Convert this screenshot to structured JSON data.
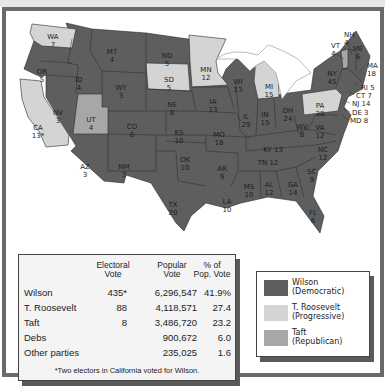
{
  "colors": {
    "wilson": "#5e5e5e",
    "roosevelt": "#d4d4d4",
    "taft": "#a7a7a7",
    "frame": "#6a6a6a",
    "water": "#ffffff"
  },
  "map": {
    "states": [
      {
        "abbr": "WA",
        "ev": "7",
        "winner": "roosevelt",
        "x": 47,
        "y": 22
      },
      {
        "abbr": "OR",
        "ev": "5",
        "winner": "wilson",
        "x": 36,
        "y": 57
      },
      {
        "abbr": "CA",
        "ev": "13*",
        "winner": "roosevelt",
        "x": 32,
        "y": 113
      },
      {
        "abbr": "ID",
        "ev": "4",
        "winner": "wilson",
        "x": 73,
        "y": 65
      },
      {
        "abbr": "NV",
        "ev": "3",
        "winner": "wilson",
        "x": 52,
        "y": 98
      },
      {
        "abbr": "MT",
        "ev": "4",
        "winner": "wilson",
        "x": 106,
        "y": 37
      },
      {
        "abbr": "WY",
        "ev": "3",
        "winner": "wilson",
        "x": 115,
        "y": 73
      },
      {
        "abbr": "UT",
        "ev": "4",
        "winner": "taft",
        "x": 85,
        "y": 105
      },
      {
        "abbr": "CO",
        "ev": "6",
        "winner": "wilson",
        "x": 126,
        "y": 112
      },
      {
        "abbr": "AZ",
        "ev": "3",
        "winner": "wilson",
        "x": 79,
        "y": 152
      },
      {
        "abbr": "NM",
        "ev": "3",
        "winner": "wilson",
        "x": 118,
        "y": 152
      },
      {
        "abbr": "ND",
        "ev": "5",
        "winner": "wilson",
        "x": 161,
        "y": 41
      },
      {
        "abbr": "SD",
        "ev": "5",
        "winner": "roosevelt",
        "x": 163,
        "y": 65
      },
      {
        "abbr": "NE",
        "ev": "8",
        "winner": "wilson",
        "x": 166,
        "y": 90
      },
      {
        "abbr": "KS",
        "ev": "10",
        "winner": "wilson",
        "x": 173,
        "y": 118
      },
      {
        "abbr": "OK",
        "ev": "10",
        "winner": "wilson",
        "x": 179,
        "y": 145
      },
      {
        "abbr": "TX",
        "ev": "20",
        "winner": "wilson",
        "x": 167,
        "y": 190
      },
      {
        "abbr": "MN",
        "ev": "12",
        "winner": "roosevelt",
        "x": 200,
        "y": 55
      },
      {
        "abbr": "IA",
        "ev": "13",
        "winner": "wilson",
        "x": 207,
        "y": 87
      },
      {
        "abbr": "MO",
        "ev": "18",
        "winner": "wilson",
        "x": 213,
        "y": 120
      },
      {
        "abbr": "AR",
        "ev": "9",
        "winner": "wilson",
        "x": 216,
        "y": 154
      },
      {
        "abbr": "LA",
        "ev": "10",
        "winner": "wilson",
        "x": 221,
        "y": 187
      },
      {
        "abbr": "WI",
        "ev": "13",
        "winner": "wilson",
        "x": 232,
        "y": 67
      },
      {
        "abbr": "IL",
        "ev": "29",
        "winner": "wilson",
        "x": 240,
        "y": 102
      },
      {
        "abbr": "MI",
        "ev": "15",
        "winner": "roosevelt",
        "x": 263,
        "y": 72
      },
      {
        "abbr": "IN",
        "ev": "15",
        "winner": "wilson",
        "x": 259,
        "y": 100
      },
      {
        "abbr": "OH",
        "ev": "24",
        "winner": "wilson",
        "x": 282,
        "y": 96
      },
      {
        "abbr": "KY",
        "ev": "13",
        "winner": "wilson",
        "x": 267,
        "y": 135
      },
      {
        "abbr": "TN",
        "ev": "12",
        "winner": "wilson",
        "x": 262,
        "y": 148
      },
      {
        "abbr": "MS",
        "ev": "10",
        "winner": "wilson",
        "x": 243,
        "y": 172
      },
      {
        "abbr": "AL",
        "ev": "12",
        "winner": "wilson",
        "x": 263,
        "y": 170
      },
      {
        "abbr": "GA",
        "ev": "14",
        "winner": "wilson",
        "x": 287,
        "y": 170
      },
      {
        "abbr": "FL",
        "ev": "6",
        "winner": "wilson",
        "x": 307,
        "y": 198
      },
      {
        "abbr": "SC",
        "ev": "9",
        "winner": "wilson",
        "x": 306,
        "y": 157
      },
      {
        "abbr": "NC",
        "ev": "12",
        "winner": "wilson",
        "x": 317,
        "y": 135
      },
      {
        "abbr": "VA",
        "ev": "12",
        "winner": "wilson",
        "x": 314,
        "y": 113
      },
      {
        "abbr": "WV",
        "ev": "8",
        "winner": "wilson",
        "x": 296,
        "y": 112
      },
      {
        "abbr": "PA",
        "ev": "38",
        "winner": "roosevelt",
        "x": 314,
        "y": 91
      },
      {
        "abbr": "NY",
        "ev": "45",
        "winner": "wilson",
        "x": 326,
        "y": 59
      },
      {
        "abbr": "ME",
        "ev": "6",
        "winner": "wilson",
        "x": 352,
        "y": 34
      }
    ],
    "callouts": [
      {
        "abbr": "VT",
        "ev": "4",
        "x": 325,
        "y": 31
      },
      {
        "abbr": "NH",
        "ev": "4",
        "x": 338,
        "y": 20
      },
      {
        "abbr": "MA",
        "ev": "18",
        "x": 361,
        "y": 51
      },
      {
        "abbr": "RI",
        "ev": "5",
        "x": 355,
        "y": 73
      },
      {
        "abbr": "CT",
        "ev": "7",
        "x": 350,
        "y": 81
      },
      {
        "abbr": "NJ",
        "ev": "14",
        "x": 346,
        "y": 89
      },
      {
        "abbr": "DE",
        "ev": "3",
        "x": 346,
        "y": 98
      },
      {
        "abbr": "MD",
        "ev": "8",
        "x": 344,
        "y": 106
      }
    ]
  },
  "table": {
    "headers": [
      "",
      "Electoral\nVote",
      "Popular\nVote",
      "% of\nPop. Vote"
    ],
    "rows": [
      {
        "name": "Wilson",
        "ev": "435*",
        "pv": "6,296,547",
        "pct": "41.9%"
      },
      {
        "name": "T. Roosevelt",
        "ev": "88",
        "pv": "4,118,571",
        "pct": "27.4"
      },
      {
        "name": "Taft",
        "ev": "8",
        "pv": "3,486,720",
        "pct": "23.2"
      },
      {
        "name": "Debs",
        "ev": "",
        "pv": "900,672",
        "pct": "6.0"
      },
      {
        "name": "Other parties",
        "ev": "",
        "pv": "235,025",
        "pct": "1.6"
      }
    ],
    "footnote": "*Two electors in California voted for Wilson."
  },
  "legend": {
    "items": [
      {
        "label": "Wilson\n(Democratic)",
        "color": "#5e5e5e"
      },
      {
        "label": "T. Roosevelt\n(Progressive)",
        "color": "#d4d4d4"
      },
      {
        "label": "Taft\n(Republican)",
        "color": "#a7a7a7"
      }
    ]
  }
}
